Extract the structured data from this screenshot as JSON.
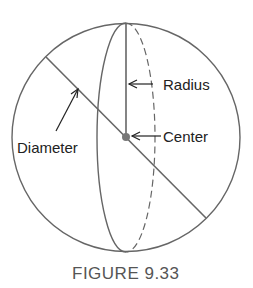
{
  "labels": {
    "radius": "Radius",
    "center": "Center",
    "diameter": "Diameter"
  },
  "caption": "FIGURE 9.33",
  "colors": {
    "stroke": "#666666",
    "text": "#222222",
    "caption": "#555555"
  }
}
